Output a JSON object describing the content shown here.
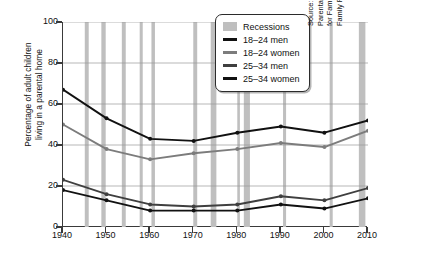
{
  "chart_data": {
    "type": "line",
    "title": "",
    "xlabel": "",
    "ylabel": "Percentage of adult children\nliving in a parental home",
    "x": [
      1940,
      1950,
      1960,
      1970,
      1980,
      1990,
      2000,
      2010
    ],
    "xticklabels": [
      "1940",
      "1950",
      "1960",
      "1970",
      "1980",
      "1990",
      "2000",
      "2010"
    ],
    "yticklabels": [
      "0",
      "20",
      "40",
      "60",
      "80",
      "100"
    ],
    "yticks": [
      0,
      20,
      40,
      60,
      80,
      100
    ],
    "xlim": [
      1940,
      2010
    ],
    "ylim": [
      0,
      100
    ],
    "grid": true,
    "legend_position": "top-right",
    "series": [
      {
        "name": "18–24 men",
        "color": "#111111",
        "values": [
          67,
          53,
          43,
          42,
          46,
          49,
          46,
          52
        ]
      },
      {
        "name": "18–24 women",
        "color": "#7c7c7c",
        "values": [
          50,
          38,
          33,
          36,
          38,
          41,
          39,
          47
        ]
      },
      {
        "name": "25–34 men",
        "color": "#3f3f3f",
        "values": [
          23,
          16,
          11,
          10,
          11,
          15,
          13,
          19
        ]
      },
      {
        "name": "25–34 women",
        "color": "#111111",
        "values": [
          18,
          13,
          8,
          8,
          8,
          11,
          9,
          14
        ]
      }
    ],
    "shaded_bands": {
      "label": "Recessions",
      "color": "#bfbfbf",
      "ranges": [
        [
          1945.0,
          1945.9
        ],
        [
          1948.8,
          1949.8
        ],
        [
          1953.5,
          1954.4
        ],
        [
          1957.6,
          1958.3
        ],
        [
          1960.3,
          1961.1
        ],
        [
          1969.9,
          1970.8
        ],
        [
          1973.9,
          1975.2
        ],
        [
          1980.0,
          1980.6
        ],
        [
          1981.5,
          1982.9
        ],
        [
          1990.5,
          1991.2
        ],
        [
          2001.2,
          2001.9
        ],
        [
          2007.9,
          2009.4
        ]
      ]
    }
  },
  "legend": {
    "entries": [
      {
        "label": "Recessions",
        "type": "swatch",
        "color": "#bfbfbf"
      },
      {
        "label": "18–24 men",
        "type": "line",
        "color": "#111111"
      },
      {
        "label": "18–24 women",
        "type": "line",
        "color": "#7c7c7c"
      },
      {
        "label": "25–34 men",
        "type": "line",
        "color": "#3f3f3f"
      },
      {
        "label": "25–34 women",
        "type": "line",
        "color": "#111111"
      }
    ]
  },
  "source": {
    "text": "Source: Payne, Krista. “FP-12-22 Young Adults in the\nParental Home, 1940–2010” (2012). National Center\nfor Family and Marriage Research\nFamily Profiles. Paper 16. Retrieved from:"
  }
}
